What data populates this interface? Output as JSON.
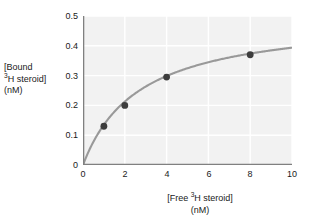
{
  "chart_data": {
    "type": "line",
    "title": "",
    "xlabel": "[Free 3H steroid] (nM)",
    "ylabel": "[Bound 3H steroid] (nM)",
    "xlim": [
      0,
      10
    ],
    "ylim": [
      0,
      0.5
    ],
    "xticks": [
      "0",
      "2",
      "4",
      "6",
      "8",
      "10"
    ],
    "xtick_values": [
      0,
      2,
      4,
      6,
      8,
      10
    ],
    "yticks": [
      "0",
      "0.1",
      "0.2",
      "0.3",
      "0.4",
      "0.5"
    ],
    "ytick_values": [
      0,
      0.1,
      0.2,
      0.3,
      0.4,
      0.5
    ],
    "grid": true,
    "grid_color": "#ffffff",
    "plot_background": "#f2f2f2",
    "legend": "none",
    "series": [
      {
        "name": "Saturation binding curve",
        "type": "line",
        "color": "#999999",
        "model": "hyperbolic saturation: B = Bmax * F / (Kd + F)",
        "Bmax": 0.5,
        "Kd": 2.7,
        "x": [
          0,
          10
        ],
        "curve_y_endpoint": 0.394
      },
      {
        "name": "Measured data points",
        "type": "scatter",
        "color": "#3d3d3d",
        "marker": "filled-circle",
        "x": [
          1,
          2,
          4,
          8
        ],
        "values": [
          0.13,
          0.2,
          0.295,
          0.37
        ]
      }
    ]
  },
  "axis_labels": {
    "y": {
      "line1": "[Bound",
      "line2_pre": "",
      "line2_sup": "3",
      "line2_post": "H steroid]",
      "line3": "(nM)"
    },
    "x": {
      "line1_pre": "[Free ",
      "line1_sup": "3",
      "line1_post": "H steroid]",
      "line2": "(nM)"
    }
  }
}
